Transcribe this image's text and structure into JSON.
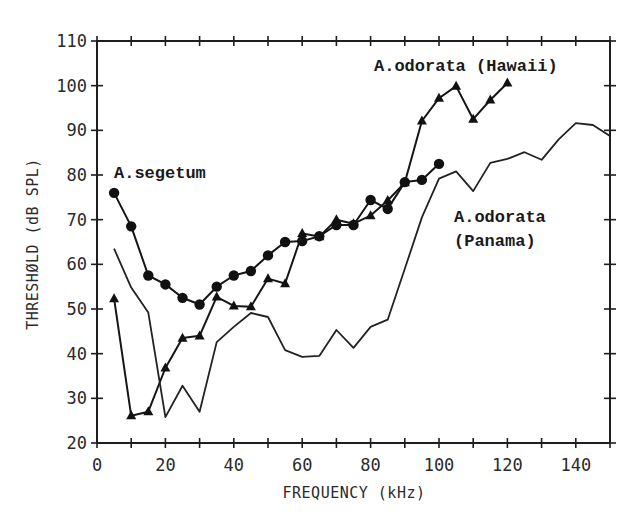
{
  "chart_data": {
    "type": "line",
    "title": "",
    "xlabel": "FREQUENCY (kHz)",
    "ylabel": "THRESHØLD (dB SPL)",
    "xlim": [
      0,
      150
    ],
    "ylim": [
      20,
      110
    ],
    "x_ticks": [
      0,
      20,
      40,
      60,
      80,
      100,
      120,
      140
    ],
    "x_minor_ticks_step": 10,
    "y_ticks": [
      20,
      30,
      40,
      50,
      60,
      70,
      80,
      90,
      100,
      110
    ],
    "grid": false,
    "legend": "inline labels",
    "series": [
      {
        "name": "A.segetum",
        "marker": "circle",
        "label_lines": [
          "A.segetum"
        ],
        "label_pos": {
          "x": 114,
          "y": 178
        },
        "x": [
          5,
          10,
          15,
          20,
          25,
          30,
          35,
          40,
          45,
          50,
          55,
          60,
          65,
          70,
          75,
          80,
          85,
          90,
          95,
          100
        ],
        "values": [
          76,
          68.5,
          57.5,
          55.5,
          52.5,
          51,
          55,
          57.5,
          58.5,
          62,
          65,
          65.2,
          66.3,
          68.8,
          68.8,
          74.4,
          72.4,
          78.4,
          78.9,
          82.5
        ]
      },
      {
        "name": "A.odorata (Hawaii)",
        "marker": "triangle",
        "label_lines": [
          "A.odorata (Hawaii)"
        ],
        "label_pos": {
          "x": 374,
          "y": 71
        },
        "x": [
          5,
          10,
          15,
          20,
          25,
          30,
          35,
          40,
          45,
          50,
          55,
          60,
          65,
          70,
          75,
          80,
          85,
          90,
          95,
          100,
          105,
          110,
          115,
          120
        ],
        "values": [
          52.3,
          26.1,
          27,
          36.8,
          43.5,
          44,
          52.7,
          50.7,
          50.5,
          56.8,
          55.7,
          66.9,
          66.2,
          70,
          69.1,
          70.9,
          74.3,
          78.3,
          92.1,
          97.2,
          99.9,
          92.5,
          96.8,
          100.6
        ]
      },
      {
        "name": "A.odorata (Panama)",
        "marker": "none",
        "label_lines": [
          "A.odorata",
          "(Panama)"
        ],
        "label_pos": {
          "x": 454,
          "y": 222
        },
        "x": [
          5,
          10,
          15,
          20,
          25,
          30,
          35,
          40,
          45,
          50,
          55,
          60,
          65,
          70,
          75,
          80,
          85,
          90,
          95,
          100,
          105,
          110,
          115,
          120,
          125,
          130,
          135,
          140,
          145,
          150
        ],
        "values": [
          63.5,
          54.8,
          49.2,
          25.8,
          32.8,
          27,
          42.6,
          46,
          49.1,
          48.2,
          40.8,
          39.3,
          39.5,
          45.3,
          41.3,
          46,
          47.6,
          59,
          70.5,
          79.2,
          80.8,
          76.4,
          82.7,
          83.6,
          85.1,
          83.4,
          88,
          91.6,
          91.2,
          88.7
        ]
      }
    ]
  }
}
